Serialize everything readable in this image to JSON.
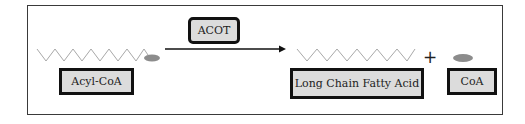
{
  "diagram": {
    "enzyme": {
      "label": "ACOT"
    },
    "substrate": {
      "label": "Acyl-CoA"
    },
    "products": [
      {
        "label": "Long Chain Fatty Acid"
      },
      {
        "label": "CoA"
      }
    ],
    "operator": "+",
    "colors": {
      "frame": "#3a3a3a",
      "box_fill": "#dcdcdc",
      "box_border": "#111111",
      "chain": "#a8a8a8",
      "coa_ellipse": "#8c8c8c",
      "arrow": "#111111"
    }
  }
}
